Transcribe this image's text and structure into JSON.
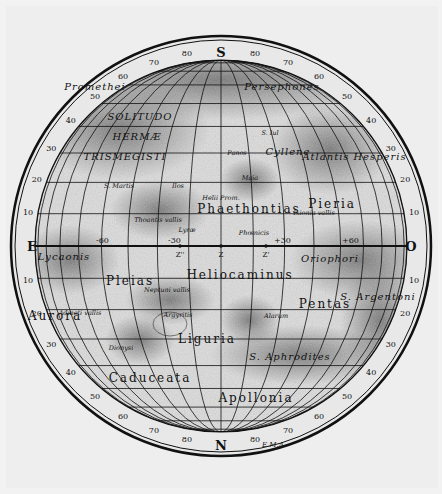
{
  "map": {
    "title": "Mars (South at top)",
    "colors": {
      "paper": "#ececec",
      "ink": "#111111",
      "shade": "#8a8a8a",
      "ring": "#e6e6e6"
    },
    "cardinals": {
      "top": "S",
      "bottom": "N",
      "left": "E",
      "right": "O"
    },
    "latitude_ticks": [
      "80",
      "70",
      "60",
      "50",
      "40",
      "30",
      "20",
      "10",
      "10",
      "20",
      "30",
      "40",
      "50",
      "60",
      "70",
      "80"
    ],
    "longitude_marks": [
      {
        "label": "-60",
        "x": 96,
        "y": 243
      },
      {
        "label": "-30",
        "x": 168,
        "y": 243
      },
      {
        "label": "+30",
        "x": 274,
        "y": 243
      },
      {
        "label": "+60",
        "x": 342,
        "y": 243
      }
    ],
    "meridian_points": [
      {
        "label": "Z''",
        "x": 180,
        "y": 249
      },
      {
        "label": "Z",
        "x": 221,
        "y": 249
      },
      {
        "label": "Z'",
        "x": 266,
        "y": 249
      }
    ],
    "regions": [
      {
        "name": "S. Promethei",
        "text": "Promethei",
        "x": 95,
        "y": 90,
        "cls": "lbl-mid"
      },
      {
        "name": "Persephones",
        "text": "Persephones",
        "x": 282,
        "y": 90,
        "cls": "lbl-mid"
      },
      {
        "name": "Solitudo",
        "text": "SOLITUDO",
        "x": 140,
        "y": 120,
        "cls": "lbl-mid"
      },
      {
        "name": "Hermae",
        "text": "HERMÆ",
        "x": 137,
        "y": 140,
        "cls": "lbl-mid"
      },
      {
        "name": "Trismegisti",
        "text": "TRISMEGISTI",
        "x": 125,
        "y": 160,
        "cls": "lbl-mid"
      },
      {
        "name": "S. Panos",
        "text": "Panos",
        "x": 237,
        "y": 155,
        "cls": "lbl-sm"
      },
      {
        "name": "S. Iul",
        "text": "S. Iul",
        "x": 270,
        "y": 135,
        "cls": "lbl-sm"
      },
      {
        "name": "Cyllene",
        "text": "Cyllene",
        "x": 288,
        "y": 155,
        "cls": "lbl-mid"
      },
      {
        "name": "Atlantis",
        "text": "Atlantis",
        "x": 326,
        "y": 160,
        "cls": "lbl-mid"
      },
      {
        "name": "Hesperis",
        "text": "Hesperis",
        "x": 380,
        "y": 160,
        "cls": "lbl-mid"
      },
      {
        "name": "S. Martis",
        "text": "S. Martis",
        "x": 119,
        "y": 188,
        "cls": "lbl-sm"
      },
      {
        "name": "S. Ilos",
        "text": "Ilos",
        "x": 178,
        "y": 188,
        "cls": "lbl-sm"
      },
      {
        "name": "S. Maia",
        "text": "Maia",
        "x": 250,
        "y": 180,
        "cls": "lbl-sm"
      },
      {
        "name": "Helii Prom.",
        "text": "Helii Prom.",
        "x": 221,
        "y": 200,
        "cls": "lbl-sm"
      },
      {
        "name": "Phaethontias",
        "text": "Phaethontias",
        "x": 249,
        "y": 213,
        "cls": "lbl-big"
      },
      {
        "name": "Pieria",
        "text": "Pieria",
        "x": 332,
        "y": 208,
        "cls": "lbl-big"
      },
      {
        "name": "Thoantis vallis",
        "text": "Thoantis vallis",
        "x": 158,
        "y": 222,
        "cls": "lbl-sm"
      },
      {
        "name": "Lyrae",
        "text": "Lyræ",
        "x": 187,
        "y": 232,
        "cls": "lbl-sm"
      },
      {
        "name": "Phoenicis",
        "text": "Phœnicis",
        "x": 254,
        "y": 235,
        "cls": "lbl-sm"
      },
      {
        "name": "Ixionia vallis",
        "text": "Ixionia vallis",
        "x": 314,
        "y": 215,
        "cls": "lbl-sm"
      },
      {
        "name": "Lycaonis",
        "text": "Lycaonis",
        "x": 64,
        "y": 260,
        "cls": "lbl-mid"
      },
      {
        "name": "Oriophori",
        "text": "Oriophori",
        "x": 330,
        "y": 262,
        "cls": "lbl-mid"
      },
      {
        "name": "Pleias",
        "text": "Pleias",
        "x": 130,
        "y": 285,
        "cls": "lbl-big"
      },
      {
        "name": "Neptuni vallis",
        "text": "Neptuni vallis",
        "x": 167,
        "y": 292,
        "cls": "lbl-sm"
      },
      {
        "name": "Heliocaminus",
        "text": "Heliocaminus",
        "x": 240,
        "y": 279,
        "cls": "lbl-big"
      },
      {
        "name": "Argyritis",
        "text": "Argyritis",
        "x": 178,
        "y": 317,
        "cls": "lbl-sm"
      },
      {
        "name": "Alarum",
        "text": "Alarum",
        "x": 276,
        "y": 318,
        "cls": "lbl-sm"
      },
      {
        "name": "Pentas",
        "text": "Pentas",
        "x": 325,
        "y": 308,
        "cls": "lbl-big"
      },
      {
        "name": "S. Argentoni",
        "text": "S. Argentoni",
        "x": 378,
        "y": 300,
        "cls": "lbl-mid"
      },
      {
        "name": "Admeti vallis",
        "text": "Admeti vallis",
        "x": 80,
        "y": 315,
        "cls": "lbl-sm"
      },
      {
        "name": "Aurora",
        "text": "Aurora",
        "x": 55,
        "y": 320,
        "cls": "lbl-big"
      },
      {
        "name": "Liguria",
        "text": "Liguria",
        "x": 207,
        "y": 343,
        "cls": "lbl-big"
      },
      {
        "name": "S. Dionysi",
        "text": "Dionysi",
        "x": 121,
        "y": 350,
        "cls": "lbl-sm"
      },
      {
        "name": "S. Aphrodites",
        "text": "S. Aphrodites",
        "x": 290,
        "y": 360,
        "cls": "lbl-mid"
      },
      {
        "name": "Caduceata",
        "text": "Caduceata",
        "x": 150,
        "y": 382,
        "cls": "lbl-big"
      },
      {
        "name": "Apollonia",
        "text": "Apollonia",
        "x": 256,
        "y": 402,
        "cls": "lbl-big"
      }
    ],
    "signature": "E.M.A."
  }
}
